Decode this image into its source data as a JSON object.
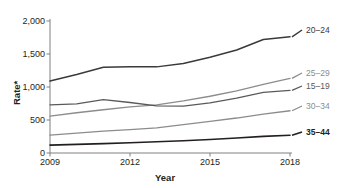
{
  "chart_data": {
    "type": "line",
    "title": "",
    "xlabel": "Year",
    "ylabel": "Rate*",
    "x": [
      2009,
      2010,
      2011,
      2012,
      2013,
      2014,
      2015,
      2016,
      2017,
      2018
    ],
    "xlim": [
      2009,
      2018
    ],
    "ylim": [
      0,
      2000
    ],
    "xticks": [
      "2009",
      "2012",
      "2015",
      "2018"
    ],
    "xtick_values": [
      2009,
      2012,
      2015,
      2018
    ],
    "yticks": [
      "0",
      "500",
      "1,000",
      "1,500",
      "2,000"
    ],
    "ytick_values": [
      0,
      500,
      1000,
      1500,
      2000
    ],
    "grid": false,
    "legend_position": "right-inline",
    "series": [
      {
        "name": "20–24",
        "color": "#3a3a3a",
        "width": 1.5,
        "values": [
          1090,
          1190,
          1300,
          1305,
          1305,
          1355,
          1450,
          1560,
          1720,
          1760
        ]
      },
      {
        "name": "25–29",
        "color": "#8c8c8c",
        "width": 1.3,
        "values": [
          560,
          610,
          655,
          700,
          730,
          790,
          860,
          940,
          1040,
          1130
        ]
      },
      {
        "name": "15–19",
        "color": "#5a5a5a",
        "width": 1.3,
        "values": [
          730,
          745,
          810,
          765,
          715,
          710,
          760,
          830,
          920,
          950
        ]
      },
      {
        "name": "30–34",
        "color": "#8c8c8c",
        "width": 1.3,
        "values": [
          270,
          300,
          330,
          355,
          380,
          430,
          480,
          530,
          590,
          640
        ]
      },
      {
        "name": "35–44",
        "color": "#231f20",
        "width": 1.6,
        "values": [
          120,
          130,
          142,
          155,
          170,
          185,
          205,
          228,
          252,
          270
        ]
      }
    ]
  },
  "axis": {
    "color": "#808080"
  }
}
